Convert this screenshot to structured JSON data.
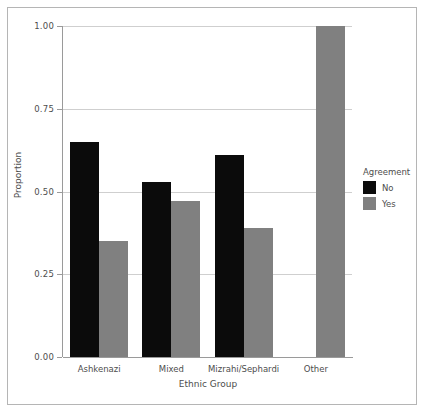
{
  "chart_data": {
    "type": "bar",
    "title": "",
    "subtitle": "",
    "xlabel": "Ethnic Group",
    "ylabel": "Proportion",
    "categories": [
      "Ashkenazi",
      "Mixed",
      "Mizrahi/Sephardi",
      "Other"
    ],
    "series": [
      {
        "name": "No",
        "color": "#0b0b0b",
        "values": [
          0.65,
          0.53,
          0.61,
          0.0
        ]
      },
      {
        "name": "Yes",
        "color": "#808080",
        "values": [
          0.35,
          0.47,
          0.39,
          1.0
        ]
      }
    ],
    "ylim": [
      0.0,
      1.0
    ],
    "yticks": [
      0.0,
      0.25,
      0.5,
      0.75,
      1.0
    ],
    "ytick_labels": [
      "0.00",
      "0.25",
      "0.50",
      "0.75",
      "1.00"
    ],
    "grid": true,
    "grid_axis": "y",
    "legend": {
      "title": "Agreement",
      "position": "right",
      "entries": [
        {
          "label": "No",
          "color": "#0b0b0b"
        },
        {
          "label": "Yes",
          "color": "#808080"
        }
      ]
    },
    "bar_mode": "dodge",
    "panel_background": "#ffffff",
    "grid_color": "#cfcfcf",
    "axis_color": "#9a9a9a",
    "text_color": "#4d4d4d",
    "frame_color": "#b5b5b5"
  }
}
